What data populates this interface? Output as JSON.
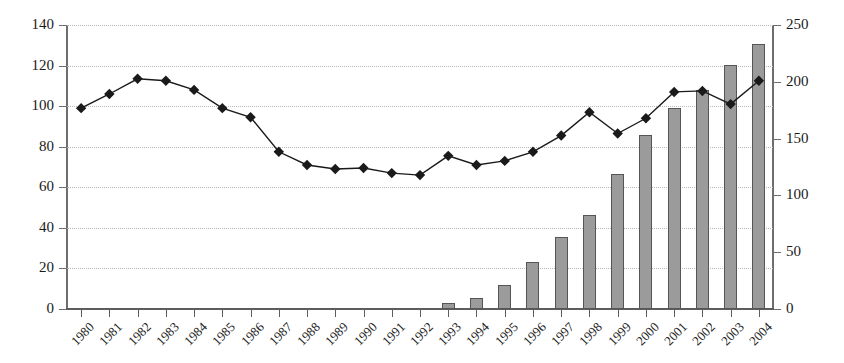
{
  "chart_data": {
    "type": "bar",
    "title": "",
    "subtitle": "",
    "xlabel": "",
    "ylabel": "",
    "grid": true,
    "legend": "none",
    "categories": [
      "1980",
      "1981",
      "1982",
      "1983",
      "1984",
      "1985",
      "1986",
      "1987",
      "1988",
      "1989",
      "1990",
      "1991",
      "1992",
      "1993",
      "1994",
      "1995",
      "1996",
      "1997",
      "1998",
      "1999",
      "2000",
      "2001",
      "2002",
      "2003",
      "2004"
    ],
    "axes": {
      "left": {
        "ticks": [
          0,
          20,
          40,
          60,
          80,
          100,
          120,
          140
        ],
        "ylim": [
          0,
          140
        ],
        "tick_labels": [
          "0",
          "20",
          "40",
          "60",
          "80",
          "100",
          "120",
          "140"
        ]
      },
      "right": {
        "ticks": [
          0,
          50,
          100,
          150,
          200,
          250
        ],
        "ylim": [
          0,
          250
        ],
        "tick_labels": [
          "0",
          "50",
          "100",
          "150",
          "200",
          "250"
        ]
      }
    },
    "series": [
      {
        "name": "bars",
        "type": "bar",
        "axis": "right",
        "color": "#9b9b9b",
        "edge_color": "#555555",
        "values": [
          0,
          0,
          0,
          0,
          0,
          0,
          0,
          0,
          0,
          0,
          0,
          0,
          0,
          5,
          10,
          21,
          41,
          63,
          83,
          119,
          153,
          177,
          193,
          215,
          233
        ]
      },
      {
        "name": "line",
        "type": "line",
        "axis": "left",
        "color": "#1a1a1a",
        "marker": "diamond",
        "values": [
          99,
          106,
          113.5,
          112.5,
          108,
          99,
          94.5,
          77.5,
          71,
          69,
          69.5,
          67,
          66,
          75.5,
          71,
          73,
          77.5,
          85.5,
          97,
          86.5,
          94,
          107,
          107.5,
          101,
          112.5
        ]
      }
    ]
  }
}
